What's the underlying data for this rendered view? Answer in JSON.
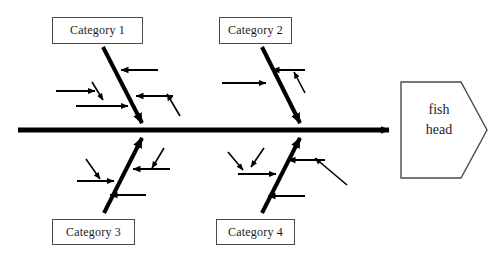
{
  "diagram": {
    "type": "fishbone-ishikawa",
    "title": "",
    "spine": {
      "label": "",
      "start_x": 18,
      "end_x": 400,
      "y": 130,
      "color": "#000000",
      "thickness": 5,
      "arrow": "right"
    },
    "head": {
      "label_line1": "fish",
      "label_line2": "head",
      "shape": "pentagon-arrow",
      "border_color": "#4a4a4a",
      "fill_color": "#ffffff"
    },
    "categories": [
      {
        "id": "category-1",
        "label": "Category 1",
        "position": "upper-left",
        "box": {
          "x": 52,
          "y": 17,
          "w": 91,
          "h": 27
        },
        "bone": {
          "x1": 103,
          "y1": 47,
          "x2": 146,
          "y2": 131
        },
        "cause_arrow_count": 4
      },
      {
        "id": "category-2",
        "label": "Category 2",
        "position": "upper-right",
        "box": {
          "x": 219,
          "y": 17,
          "w": 73,
          "h": 27
        },
        "bone": {
          "x1": 262,
          "y1": 47,
          "x2": 304,
          "y2": 131
        },
        "cause_arrow_count": 3
      },
      {
        "id": "category-3",
        "label": "Category 3",
        "position": "lower-left",
        "box": {
          "x": 52,
          "y": 219,
          "w": 83,
          "h": 26
        },
        "bone": {
          "x1": 104,
          "y1": 213,
          "x2": 146,
          "y2": 130
        },
        "cause_arrow_count": 4
      },
      {
        "id": "category-4",
        "label": "Category 4",
        "position": "lower-right",
        "box": {
          "x": 216,
          "y": 219,
          "w": 79,
          "h": 26
        },
        "bone": {
          "x1": 262,
          "y1": 213,
          "x2": 304,
          "y2": 130
        },
        "cause_arrow_count": 5
      }
    ],
    "colors": {
      "line": "#000000",
      "box_border": "#4a4a4a",
      "background": "#ffffff",
      "text": "#1a1a1a"
    }
  }
}
